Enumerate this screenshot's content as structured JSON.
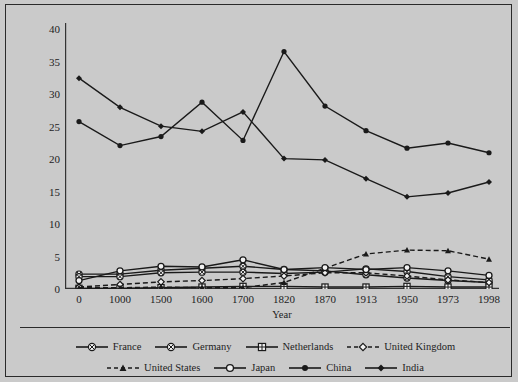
{
  "chart_data": {
    "type": "line",
    "title": "",
    "xlabel": "Year",
    "ylabel": "Share of world population",
    "categories": [
      "0",
      "1000",
      "1500",
      "1600",
      "1700",
      "1820",
      "1870",
      "1913",
      "1950",
      "1973",
      "1998"
    ],
    "x_tick_labels": [
      "0",
      "1000",
      "1500",
      "1600",
      "1700",
      "1820",
      "1870",
      "1913",
      "1950",
      "1973",
      "1998"
    ],
    "y_tick_labels": [
      "0",
      "5",
      "10",
      "15",
      "20",
      "25",
      "30",
      "35",
      "40"
    ],
    "y_ticks": [
      0,
      5,
      10,
      15,
      20,
      25,
      30,
      35,
      40
    ],
    "ylim": [
      0,
      41
    ],
    "grid": false,
    "legend_position": "bottom",
    "series": [
      {
        "name": "France",
        "marker": "crossed-circle",
        "line": "solid",
        "values": [
          2.3,
          2.3,
          2.9,
          3.2,
          3.5,
          3.0,
          2.8,
          2.2,
          1.7,
          1.3,
          1.0
        ]
      },
      {
        "name": "Germany",
        "marker": "crossed-circle",
        "line": "solid",
        "values": [
          1.9,
          1.9,
          2.5,
          2.6,
          2.6,
          2.4,
          2.6,
          3.1,
          2.7,
          1.9,
          1.4
        ]
      },
      {
        "name": "Netherlands",
        "marker": "crossed-square",
        "line": "solid",
        "values": [
          0.1,
          0.1,
          0.2,
          0.3,
          0.4,
          0.4,
          0.3,
          0.3,
          0.4,
          0.3,
          0.3
        ]
      },
      {
        "name": "United Kingdom",
        "marker": "diamond-open",
        "line": "dashed",
        "values": [
          0.3,
          0.7,
          1.1,
          1.3,
          1.6,
          2.0,
          2.5,
          2.5,
          2.0,
          1.4,
          1.0
        ]
      },
      {
        "name": "United States",
        "marker": "triangle-filled",
        "line": "dashed",
        "values": [
          0.2,
          0.2,
          0.3,
          0.2,
          0.2,
          1.0,
          3.2,
          5.4,
          6.0,
          5.9,
          4.6
        ]
      },
      {
        "name": "Japan",
        "marker": "circle-open",
        "line": "solid",
        "values": [
          1.3,
          2.8,
          3.5,
          3.4,
          4.5,
          3.0,
          3.3,
          3.0,
          3.3,
          2.8,
          2.1
        ]
      },
      {
        "name": "China",
        "marker": "circle-filled",
        "line": "solid",
        "values": [
          25.8,
          22.1,
          23.5,
          28.8,
          22.9,
          36.6,
          28.2,
          24.4,
          21.7,
          22.5,
          21.0
        ]
      },
      {
        "name": "India",
        "marker": "diamond-filled",
        "line": "solid",
        "values": [
          32.5,
          28.0,
          25.1,
          24.3,
          27.3,
          20.1,
          19.9,
          17.0,
          14.2,
          14.8,
          16.5
        ]
      }
    ]
  },
  "legend": {
    "row1": [
      "France",
      "Germany",
      "Netherlands",
      "United Kingdom"
    ],
    "row2": [
      "United States",
      "Japan",
      "China",
      "India"
    ]
  }
}
